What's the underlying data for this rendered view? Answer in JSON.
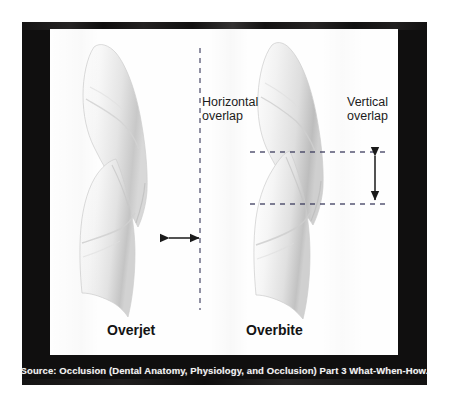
{
  "figure": {
    "title_left": "Overjet",
    "title_right": "Overbite",
    "label_horizontal_overlap": "Horizontal\noverlap",
    "label_vertical_overlap": "Vertical\noverlap",
    "caption": "Source: Occlusion (Dental Anatomy, Physiology, and Occlusion) Part 3 What-When-How.",
    "colors": {
      "frame": "#100f0f",
      "panel": "#fefefe",
      "tooth_fill": "#f4f4f4",
      "tooth_shade": "#c9c9c9",
      "guide_line": "#3b3b5c",
      "arrow": "#1a1a1a",
      "caption_text": "#f2f2f2",
      "label_text": "#1c1c1c"
    },
    "annotations": {
      "overjet_guide_orientation": "vertical-dashed",
      "overjet_measure_arrow": "horizontal-double-arrow",
      "overbite_guide_orientation": "two-horizontal-dashed",
      "overbite_measure_arrow": "vertical-double-arrow"
    }
  }
}
